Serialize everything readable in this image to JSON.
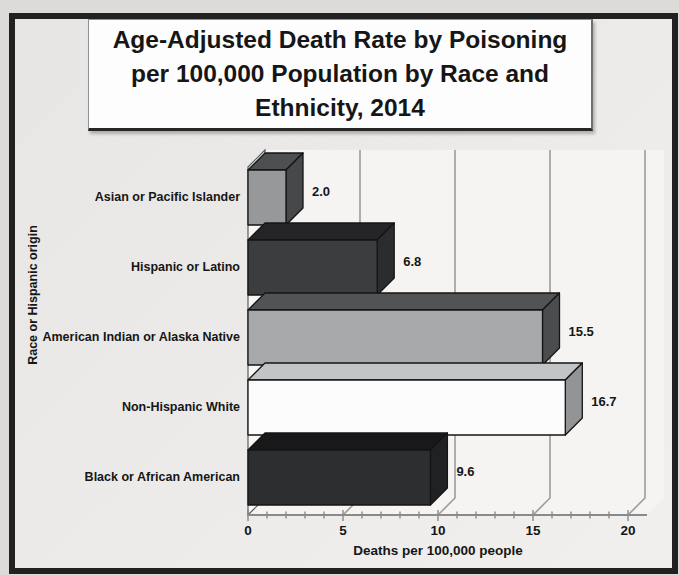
{
  "window": {
    "kind": "scanned-presentation-slide-with-3d-bar-chart"
  },
  "chart_data": {
    "type": "bar",
    "orientation": "horizontal",
    "style": "3d-boxes",
    "title": "Age-Adjusted Death Rate by Poisoning per 100,000 Population by Race and Ethnicity, 2014",
    "title_lines": [
      "Age-Adjusted Death Rate by Poisoning",
      "per 100,000 Population by Race and",
      "Ethnicity, 2014"
    ],
    "categories": [
      "Asian or Pacific Islander",
      "Hispanic or Latino",
      "American Indian or Alaska Native",
      "Non-Hispanic White",
      "Black or African American"
    ],
    "values": [
      2.0,
      6.8,
      15.5,
      16.7,
      9.6
    ],
    "value_labels": [
      "2.0",
      "6.8",
      "15.5",
      "16.7",
      "9.6"
    ],
    "xlabel": "Deaths per 100,000 people",
    "ylabel": "Race or Hispanic origin",
    "xlim": [
      0,
      20
    ],
    "x_ticks": [
      "0",
      "5",
      "10",
      "15",
      "20"
    ],
    "x_tick_values": [
      0,
      5,
      10,
      15,
      20
    ],
    "x_minor_tick_step": 1,
    "grid": "vertical gridlines at major ticks on 3d back wall",
    "legend": "none",
    "bar_colors": [
      {
        "front": "#97989a",
        "top": "#4e4f51",
        "side": "#47484a"
      },
      {
        "front": "#3c3d3f",
        "top": "#252527",
        "side": "#2b2c2e"
      },
      {
        "front": "#a7a8aa",
        "top": "#525355",
        "side": "#4b4c4e"
      },
      {
        "front": "#fcfcfc",
        "top": "#c3c4c6",
        "side": "#939496"
      },
      {
        "front": "#2d2e30",
        "top": "#18181a",
        "side": "#202123"
      }
    ]
  },
  "colors": {
    "page_background": "#dcdbd9",
    "slide_background": "#ebeae8",
    "frame_border": "#212121",
    "plot_background": "#f5f4f2",
    "gridline": "#9c9c9c",
    "axis": "#8a8a8a",
    "bar_outline": "#141414",
    "text": "#161616",
    "title_box_background": "#fdfdfd"
  }
}
